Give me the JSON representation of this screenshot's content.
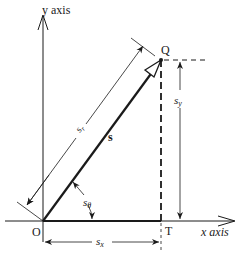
{
  "diagram": {
    "type": "vector-components",
    "axes": {
      "y_label": "y axis",
      "x_label": "x axis"
    },
    "points": {
      "origin": "O",
      "tip": "Q",
      "projection": "T"
    },
    "vector": {
      "name": "s"
    },
    "dimensions": {
      "magnitude": {
        "base": "s",
        "sub": "r"
      },
      "angle": {
        "base": "s",
        "sub": "θ"
      },
      "x_component": {
        "base": "s",
        "sub": "x"
      },
      "y_component": {
        "base": "s",
        "sub": "y"
      }
    },
    "colors": {
      "ink": "#1a1a1a",
      "background": "#ffffff"
    }
  }
}
